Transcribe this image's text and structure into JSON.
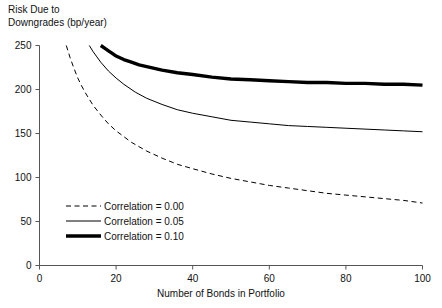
{
  "chart_data": {
    "type": "line",
    "title": "",
    "ylabel": "Risk Due to\nDowngrades (bp/year)",
    "xlabel": "Number of Bonds in Portfolio",
    "xlim": [
      0,
      100
    ],
    "ylim": [
      0,
      250
    ],
    "xticks": [
      0,
      20,
      40,
      60,
      80,
      100
    ],
    "yticks": [
      0,
      50,
      100,
      150,
      200,
      250
    ],
    "grid": false,
    "legend_position": "lower-left-inside",
    "series": [
      {
        "name": "Correlation = 0.00",
        "style": "dashed",
        "color": "#000000",
        "width": 1,
        "x": [
          7,
          8,
          9,
          10,
          11,
          12,
          14,
          16,
          18,
          20,
          24,
          28,
          32,
          36,
          40,
          45,
          50,
          55,
          60,
          65,
          70,
          75,
          80,
          85,
          90,
          95,
          100
        ],
        "y": [
          250,
          236,
          224,
          213,
          204,
          196,
          182,
          171,
          161,
          153,
          140,
          130,
          122,
          115,
          110,
          104,
          99,
          95,
          91,
          88,
          85,
          82,
          80,
          78,
          76,
          74,
          71
        ]
      },
      {
        "name": "Correlation = 0.05",
        "style": "solid",
        "color": "#000000",
        "width": 1,
        "x": [
          13,
          14,
          15,
          16,
          18,
          20,
          22,
          25,
          28,
          32,
          36,
          40,
          45,
          50,
          55,
          60,
          65,
          70,
          75,
          80,
          85,
          90,
          95,
          100
        ],
        "y": [
          250,
          243,
          237,
          231,
          221,
          213,
          206,
          197,
          190,
          183,
          177,
          173,
          169,
          165,
          163,
          161,
          159,
          158,
          157,
          156,
          155,
          154,
          153,
          152
        ]
      },
      {
        "name": "Correlation = 0.10",
        "style": "thick",
        "color": "#000000",
        "width": 3.4,
        "x": [
          16,
          17,
          18,
          19,
          20,
          22,
          24,
          26,
          28,
          32,
          36,
          40,
          45,
          50,
          55,
          60,
          65,
          70,
          75,
          80,
          85,
          90,
          95,
          100
        ],
        "y": [
          250,
          247,
          244,
          241,
          238,
          234,
          231,
          228,
          226,
          222,
          219,
          217,
          214,
          212,
          211,
          210,
          209,
          208,
          208,
          207,
          207,
          206,
          206,
          205
        ]
      }
    ]
  },
  "legend": {
    "items": [
      {
        "label": "Correlation = 0.00",
        "style": "dashed"
      },
      {
        "label": "Correlation = 0.05",
        "style": "solid"
      },
      {
        "label": "Correlation = 0.10",
        "style": "thick"
      }
    ]
  }
}
